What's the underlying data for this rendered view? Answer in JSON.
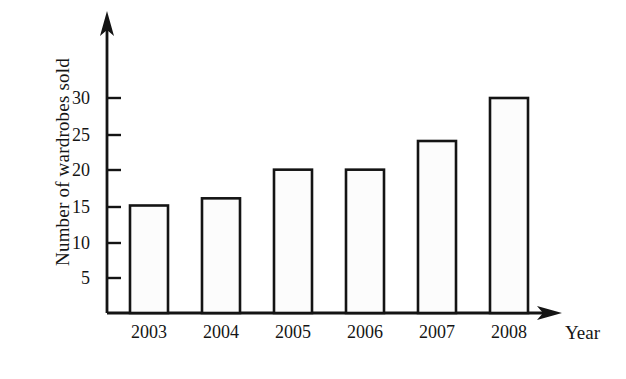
{
  "chart_data": {
    "type": "bar",
    "title": "",
    "subtitle": "",
    "xlabel": "Year",
    "ylabel": "Number of wardrobes sold",
    "categories": [
      "2003",
      "2004",
      "2005",
      "2006",
      "2007",
      "2008"
    ],
    "values": [
      15,
      16,
      20,
      20,
      24,
      30
    ],
    "series": [
      {
        "name": "Number of wardrobes sold",
        "values": [
          15,
          16,
          20,
          20,
          24,
          30
        ]
      }
    ],
    "ylim": [
      0,
      35
    ],
    "xlim": [
      0,
      6
    ],
    "y_ticks": [
      5,
      10,
      15,
      20,
      25,
      30
    ],
    "y_tick_labels": [
      "5",
      "10",
      "15",
      "20",
      "25",
      "30"
    ],
    "x_tick_labels": [
      "2003",
      "2004",
      "2005",
      "2006",
      "2007",
      "2008"
    ],
    "grid": false,
    "legend": false,
    "legend_position": "none",
    "annotations": [],
    "axis_arrows": true,
    "bar_fill_color": "#fcfcfc",
    "bar_edge_color": "#141414",
    "axis_color": "#141414",
    "background_color": "#ffffff"
  },
  "axis": {
    "y_title": "Number of wardrobes sold",
    "x_title": "Year"
  }
}
